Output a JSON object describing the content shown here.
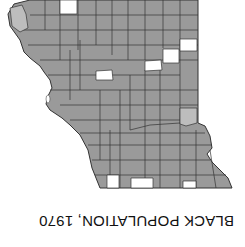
{
  "title": "BLACK POPULATION, 1970",
  "orientation": "rotated 180 degrees",
  "colors": {
    "shaded": "#9a9a9a",
    "light": "#bdbdbd",
    "none": "#ffffff",
    "border": "#333333"
  },
  "legend_classes": [
    {
      "key": "shaded",
      "fill": "#9a9a9a"
    },
    {
      "key": "light",
      "fill": "#bdbdbd"
    },
    {
      "key": "none",
      "fill": "#ffffff"
    }
  ]
}
